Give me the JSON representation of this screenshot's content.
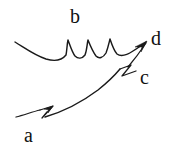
{
  "figure": {
    "background_color": "#ffffff",
    "ink_color": "#1a1a1a",
    "width": 172,
    "height": 154,
    "labels": [
      {
        "id": "a",
        "text": "a",
        "x": 24,
        "y": 125,
        "describes": "lower-curve-start"
      },
      {
        "id": "b",
        "text": "b",
        "x": 70,
        "y": 6,
        "describes": "upper-scalloped-curve"
      },
      {
        "id": "c",
        "text": "c",
        "x": 140,
        "y": 67,
        "describes": "lower-curve-break-mark"
      },
      {
        "id": "d",
        "text": "d",
        "x": 151,
        "y": 28,
        "describes": "convergence-arrow-tip"
      }
    ],
    "strokes": [
      {
        "id": "upper-scalloped-curve",
        "role": "curve-b",
        "description": "Long curve entering from upper left, dipping, then three sharp cusps, sweeping right to the arrow tip",
        "path": "M 15 42 C 25 48 34 55 46 59 C 56 62 62 60 66 55 C 67 50 67 44 68 40 C 70 45 72 52 75 56 C 78 59 82 59 85 55 C 87 50 87 44 88 40 C 90 45 93 52 96 56 C 99 59 103 58 106 53 C 108 48 109 43 110 39 C 112 45 114 51 117 54 C 121 57 127 55 133 51 C 138 48 142 45 146 42"
      },
      {
        "id": "lower-arc-left",
        "role": "curve-a-segment",
        "description": "Short stroke from lower-left rising into the first zigzag break mark",
        "path": "M 16 117 C 24 115 32 112 40 110"
      },
      {
        "id": "zigzag-break-a",
        "role": "break-mark-a",
        "description": "Lightning-bolt style break mark near label a",
        "path": "M 40 110 L 53 106 L 42 118 L 47 112"
      },
      {
        "id": "lower-arc-main",
        "role": "curve-a-to-c",
        "description": "Long smooth arc rising from the a break mark to the c break mark",
        "path": "M 45 117 C 62 112 82 102 98 90 C 108 82 115 75 120 69"
      },
      {
        "id": "zigzag-break-c",
        "role": "break-mark-c",
        "description": "Lightning-bolt style break mark near label c",
        "path": "M 120 69 L 131 65 L 122 76 L 136 71"
      },
      {
        "id": "lower-arc-right",
        "role": "curve-c-to-d",
        "description": "Final straight-ish segment from the c break mark up to the arrow tip at d",
        "path": "M 128 67 C 134 60 140 52 146 43"
      }
    ],
    "arrowheads": [
      {
        "id": "arrow-at-d",
        "points": "147 41 135 47 142 47 141 52",
        "description": "Arrowhead at the convergence point beside label d"
      },
      {
        "id": "arrow-at-a-break",
        "points": "53 106 44 109 49 110 48 113",
        "description": "Small arrowhead on the lower-left break mark"
      }
    ]
  }
}
